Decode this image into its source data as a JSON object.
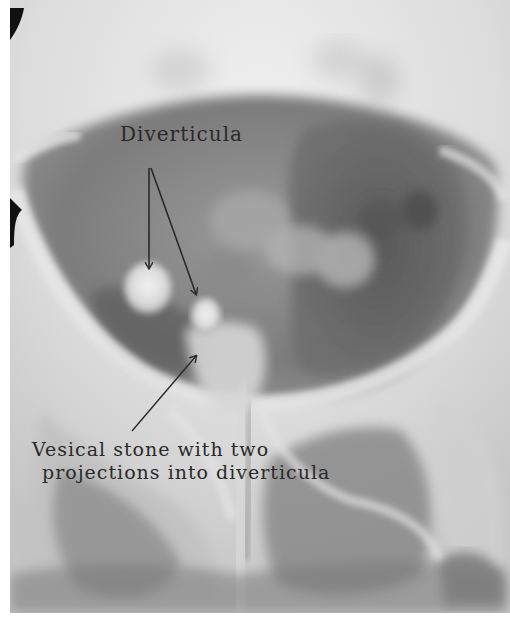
{
  "figure": {
    "type": "radiograph",
    "annotations": [
      {
        "id": "diverticula",
        "text": "Diverticula"
      },
      {
        "id": "stone",
        "lines": [
          "Vesical stone with two",
          "projections into diverticula"
        ]
      }
    ],
    "colors": {
      "bright_bone": "#ededed",
      "soft_tissue": "#b8b8b8",
      "dark_cavity": "#6e6e6e",
      "deep_dark": "#4a4a4a",
      "ink": "#2a2a2a",
      "clip_mark": "#111111"
    }
  }
}
